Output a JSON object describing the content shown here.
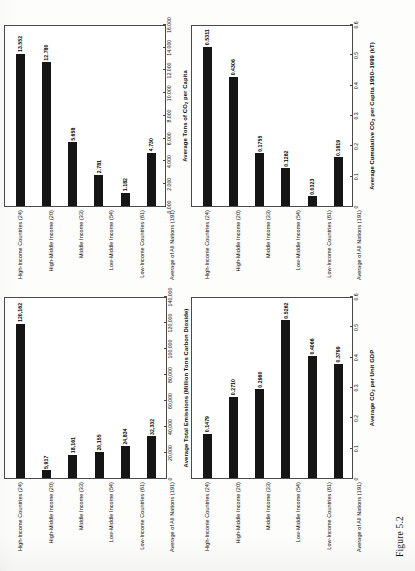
{
  "figure": {
    "caption": "Figure 5.2"
  },
  "categories": [
    "High-Income Countries (24)",
    "High-Middle Income (20)",
    "Middle Income (33)",
    "Low-Middle Income (54)",
    "Low-Income Countries (61)",
    "Average of All Nations (191)"
  ],
  "chart_data": [
    {
      "id": "total-emissions",
      "type": "bar",
      "orientation": "horizontal",
      "position": "top-left-of-page",
      "title": "",
      "xlabel": "Average Total Emissions (Million Tons Carbon Dioxide)",
      "ylabel": "",
      "categories": [
        "High-Income Countries (24)",
        "High-Middle Income (20)",
        "Middle Income (33)",
        "Low-Middle Income (54)",
        "Low-Income Countries (61)",
        "Average of All Nations (191)"
      ],
      "values": [
        120162,
        5917,
        18161,
        20155,
        24834,
        32332
      ],
      "value_labels": [
        "120,162",
        "5,917",
        "18,161",
        "20,155",
        "24,834",
        "32,332"
      ],
      "xlim": [
        0,
        140000
      ],
      "ticks": [
        0,
        20000,
        40000,
        60000,
        80000,
        100000,
        120000,
        140000
      ],
      "tick_labels": [
        "0",
        "20,000",
        "40,000",
        "60,000",
        "80,000",
        "100,000",
        "120,000",
        "140,000"
      ],
      "grid": false,
      "legend": "none"
    },
    {
      "id": "co2-per-unit-gdp",
      "type": "bar",
      "orientation": "horizontal",
      "position": "top-right-of-page",
      "title": "",
      "xlabel": "Average CO2 per Unit GDP",
      "xlabel_main": "Average CO",
      "xlabel_sub": "2",
      "xlabel_tail": " per Unit GDP",
      "ylabel": "",
      "categories": [
        "High-Income Countries (24)",
        "High-Middle Income (20)",
        "Middle Income (33)",
        "Low-Middle Income (54)",
        "Low-Income Countries (61)",
        "Average of All Nations (191)"
      ],
      "values": [
        0.1479,
        0.271,
        0.296,
        0.5262,
        0.4066,
        0.3799
      ],
      "value_labels": [
        "0.1479",
        "0.2710",
        "0.2960",
        "0.5262",
        "0.4066",
        "0.3799"
      ],
      "xlim": [
        0,
        0.6
      ],
      "ticks": [
        0,
        0.1,
        0.2,
        0.3,
        0.4,
        0.5,
        0.6
      ],
      "tick_labels": [
        "0",
        "0.1",
        "0.2",
        "0.3",
        "0.4",
        "0.5",
        "0.6"
      ],
      "grid": false,
      "legend": "none"
    },
    {
      "id": "co2-per-capita",
      "type": "bar",
      "orientation": "horizontal",
      "position": "bottom-left-of-page",
      "title": "",
      "xlabel": "Average Tons of CO2 per Capita",
      "xlabel_main": "Average Tons of CO",
      "xlabel_sub": "2",
      "xlabel_tail": " per Capita",
      "ylabel": "",
      "categories": [
        "High-Income Countries (24)",
        "High-Middle Income (20)",
        "Middle Income (33)",
        "Low-Middle Income (54)",
        "Low-Income Countries (61)",
        "Average of All Nations (191)"
      ],
      "values": [
        13.552,
        12.78,
        5.658,
        2.781,
        1.182,
        4.73
      ],
      "value_labels": [
        "13.552",
        "12.780",
        "5.658",
        "2.781",
        "1.182",
        "4.730"
      ],
      "xlim": [
        0,
        16
      ],
      "ticks": [
        0,
        2,
        4,
        6,
        8,
        10,
        12,
        14,
        16
      ],
      "tick_labels": [
        "0.000",
        "2.000",
        "4.000",
        "6.000",
        "8.000",
        "10.000",
        "12.000",
        "14.000",
        "16.000"
      ],
      "grid": false,
      "legend": "none"
    },
    {
      "id": "cumulative-co2-per-capita",
      "type": "bar",
      "orientation": "horizontal",
      "position": "bottom-right-of-page",
      "title": "",
      "xlabel": "Average Cumulative CO2 per Capita 1950-1999 (kT)",
      "xlabel_main": "Average Cumulative CO",
      "xlabel_sub": "2",
      "xlabel_tail": " per Capita 1950–1999 (kT)",
      "ylabel": "",
      "categories": [
        "High-Income Countries (24)",
        "High-Middle Income (20)",
        "Middle Income (33)",
        "Low-Middle Income (54)",
        "Low-Income Countries (61)",
        "Average of All Nations (191)"
      ],
      "values": [
        0.5311,
        0.4306,
        0.1755,
        0.1262,
        0.0323,
        0.1619
      ],
      "value_labels": [
        "0.5311",
        "0.4306",
        "0.1755",
        "0.1262",
        "0.0323",
        "0.1619"
      ],
      "xlim": [
        0,
        0.6
      ],
      "ticks": [
        0,
        0.1,
        0.2,
        0.3,
        0.4,
        0.5,
        0.6
      ],
      "tick_labels": [
        "0",
        "0.1",
        "0.2",
        "0.3",
        "0.4",
        "0.5",
        "0.6"
      ],
      "grid": false,
      "legend": "none"
    }
  ],
  "colors": {
    "bar": "#151515",
    "axis": "#4a4a4a",
    "page": "#fdfdfc",
    "text": "#0d0d0d"
  }
}
